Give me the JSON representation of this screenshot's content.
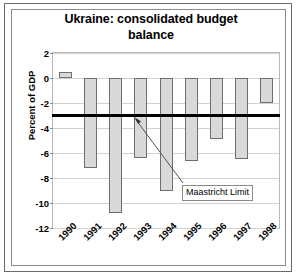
{
  "chart_data": {
    "type": "bar",
    "title": "Ukraine: consolidated budget balance",
    "title_line1": "Ukraine: consolidated budget",
    "title_line2": "balance",
    "xlabel": "",
    "ylabel": "Percent of GDP",
    "categories": [
      "1990",
      "1991",
      "1992",
      "1993",
      "1994",
      "1995",
      "1996",
      "1997",
      "1998"
    ],
    "values": [
      0.5,
      -7.2,
      -10.8,
      -6.4,
      -9.0,
      -6.6,
      -4.9,
      -6.5,
      -2.0
    ],
    "ylim": [
      -12,
      2
    ],
    "yticks": [
      2,
      0,
      -2,
      -4,
      -6,
      -8,
      -10,
      -12
    ],
    "ytick_labels": [
      "2",
      "0",
      "-2",
      "-4",
      "-6",
      "-8",
      "-10",
      "-12"
    ],
    "grid": true,
    "legend": "none",
    "annotations": [
      {
        "label": "Maastricht Limit",
        "value": -3.0,
        "kind": "threshold-line-with-callout"
      }
    ],
    "series": [
      {
        "name": "Consolidated budget balance",
        "values": [
          0.5,
          -7.2,
          -10.8,
          -6.4,
          -9.0,
          -6.6,
          -4.9,
          -6.5,
          -2.0
        ]
      }
    ],
    "colors": {
      "bar_fill": "#d9d9d9",
      "bar_border": "#6e6e6e",
      "limit_line": "#000000",
      "gridline": "#d2d2d2",
      "plot_border": "#b9b9b9",
      "text": "#000000",
      "background": "#ffffff"
    }
  }
}
